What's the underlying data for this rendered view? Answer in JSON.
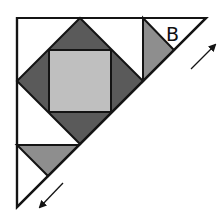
{
  "diagram": {
    "type": "quilt-block-half-square",
    "label": "B",
    "colors": {
      "background": "#ffffff",
      "outline": "#141414",
      "dark": "#5a5a5a",
      "medium": "#8e8e8e",
      "light": "#bfbfbf",
      "white": "#ffffff"
    },
    "outer_triangle": {
      "points": "17,18 206,18 17,207"
    },
    "shapes": [
      {
        "name": "dark-diamond",
        "fill": "dark",
        "points": "80,18 143,81 80,144 17,81"
      },
      {
        "name": "center-square",
        "fill": "light",
        "points": "49,50 111,50 111,112 49,112"
      },
      {
        "name": "upper-right-medium-triangle",
        "fill": "medium",
        "points": "143,18 143,81 174,50"
      },
      {
        "name": "lower-left-medium-triangle",
        "fill": "medium",
        "points": "17,145 79,145 48,176"
      }
    ],
    "lines": [
      {
        "name": "vertical-divider",
        "x1": 143,
        "y1": 18,
        "x2": 143,
        "y2": 81
      },
      {
        "name": "horizontal-divider",
        "x1": 17,
        "y1": 145,
        "x2": 79,
        "y2": 145
      }
    ],
    "arrows": [
      {
        "name": "arrow-up-right",
        "direction": "up-right",
        "x1": 191,
        "y1": 69,
        "x2": 215,
        "y2": 45
      },
      {
        "name": "arrow-down-left",
        "direction": "down-left",
        "x1": 63,
        "y1": 183,
        "x2": 40,
        "y2": 207
      }
    ],
    "label_position": {
      "x": 166,
      "y": 41
    }
  }
}
